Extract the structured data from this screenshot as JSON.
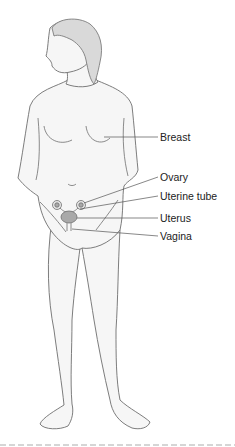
{
  "diagram": {
    "labels": [
      {
        "id": "breast",
        "text": "Breast"
      },
      {
        "id": "ovary",
        "text": "Ovary"
      },
      {
        "id": "uterine_tube",
        "text": "Uterine tube"
      },
      {
        "id": "uterus",
        "text": "Uterus"
      },
      {
        "id": "vagina",
        "text": "Vagina"
      }
    ],
    "colors": {
      "outline": "#6e6e6e",
      "skin": "#f6f6f6",
      "hair": "#d9d9d9",
      "organ": "#a9a9a9",
      "leader": "#555555"
    }
  }
}
